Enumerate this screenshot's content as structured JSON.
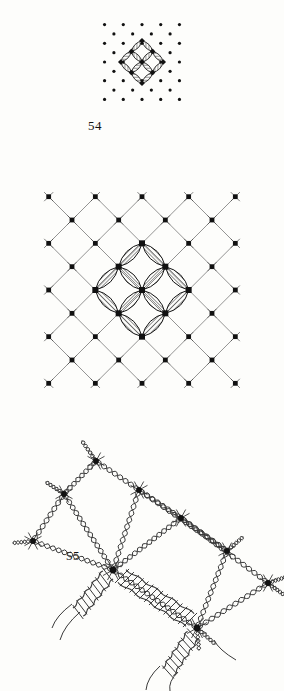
{
  "page": {
    "background_color": "#fdfdfb",
    "ink_color": "#111111",
    "width": 284,
    "height": 691,
    "kind": "scanned-plate"
  },
  "figures": [
    {
      "number": "54",
      "caption": "54",
      "title": "Pricking pattern with central rosette motif",
      "type": "dot-lattice-with-motif",
      "dot_color": "#111111",
      "dot_radius": 1.6,
      "lattice": {
        "orientation": "diamond",
        "rows": 9,
        "spacing": 13,
        "center_x": 142,
        "center_y": 62
      },
      "motif": {
        "type": "four-petal-rosette",
        "nodes": 9,
        "node_shape": "square",
        "petals": 8,
        "petal_fill": "diagonal-hatch",
        "cell_size": 15
      }
    },
    {
      "number": "55",
      "caption": "55",
      "title": "Enlarged lattice ground with hatched vesica rosette",
      "type": "lattice-with-motif",
      "line_color": "#555555",
      "node_color": "#111111",
      "lattice": {
        "orientation": "diamond",
        "rows": 9,
        "spacing": 33,
        "center_x": 142,
        "center_y": 290,
        "node_shape": "square",
        "node_size": 4.5,
        "tick_marks": true
      },
      "motif": {
        "type": "four-petal-rosette",
        "petals": 8,
        "petal_fill": "line-hatch",
        "hatch_spacing": 3,
        "cell_size": 33
      }
    },
    {
      "number": "56",
      "caption": "56",
      "title": "Worked lace structure: twisted thread pairs, knots and woven bars",
      "type": "thread-diagram",
      "thread_color": "#3a3a3a",
      "knot_color": "#111111",
      "elements": {
        "twisted_pairs": 14,
        "knot_nodes": 8,
        "woven_bars": 3,
        "bar_rungs": 14
      }
    }
  ]
}
